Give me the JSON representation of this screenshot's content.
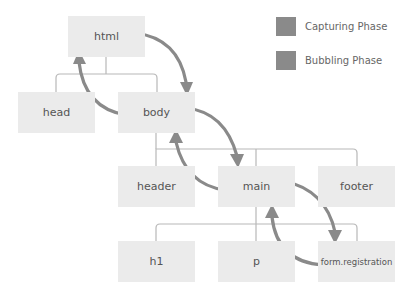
{
  "diagram": {
    "nodes": {
      "html": "html",
      "head": "head",
      "body": "body",
      "header": "header",
      "main": "main",
      "footer": "footer",
      "h1": "h1",
      "p": "p",
      "form": "form.registration"
    },
    "legend": [
      {
        "label": "Capturing Phase",
        "color": "#8a8a8a"
      },
      {
        "label": "Bubbling Phase",
        "color": "#8a8a8a"
      }
    ],
    "colors": {
      "node_fill": "#ebebeb",
      "connector": "#b5b5b5",
      "arrow": "#8a8a8a",
      "text": "#555555"
    }
  }
}
